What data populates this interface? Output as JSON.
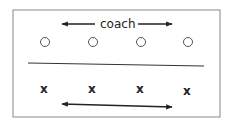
{
  "diagram": {
    "coach_label": "coach",
    "top_row": {
      "symbol": "○",
      "count": 4
    },
    "bottom_row": {
      "symbol": "x",
      "count": 4,
      "labels": [
        "x",
        "x",
        "x",
        "x"
      ]
    },
    "colors": {
      "stroke": "#333333",
      "border": "#777777"
    }
  }
}
